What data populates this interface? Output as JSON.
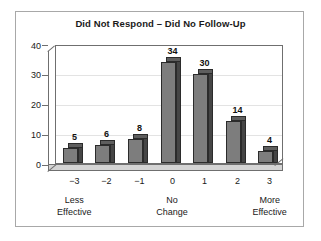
{
  "chart_data": {
    "type": "bar",
    "title": "Did Not Respond – Did No Follow-Up",
    "subtitle": "",
    "xlabel": "",
    "ylabel": "",
    "categories": [
      "−3",
      "−2",
      "−1",
      "0",
      "1",
      "2",
      "3"
    ],
    "values": [
      5,
      6,
      8,
      34,
      30,
      14,
      4
    ],
    "data_labels": [
      "5",
      "6",
      "8",
      "34",
      "30",
      "14",
      "4"
    ],
    "ylim": [
      0,
      40
    ],
    "yticks": [
      "0",
      "10",
      "20",
      "30",
      "40"
    ],
    "ytick_values": [
      0,
      10,
      20,
      30,
      40
    ],
    "grid": "horizontal",
    "legend": "none",
    "style": "3d-bar",
    "group_labels": [
      {
        "line1": "Less",
        "line2": "Effective",
        "at_category": "−3"
      },
      {
        "line1": "No",
        "line2": "Change",
        "at_category": "0"
      },
      {
        "line1": "More",
        "line2": "Effective",
        "at_category": "3"
      }
    ],
    "colors": {
      "bar_face": "#7d7d7d",
      "bar_side": "#454545",
      "bar_top": "#5e5e5e",
      "bar_outline": "#2b2b2b",
      "floor": "#d4d4d4",
      "axis": "#6f6f6f",
      "grid": "#e3e3e3",
      "text": "#1a1a1a",
      "frame": "#a8a8a8",
      "background": "#ffffff"
    }
  }
}
